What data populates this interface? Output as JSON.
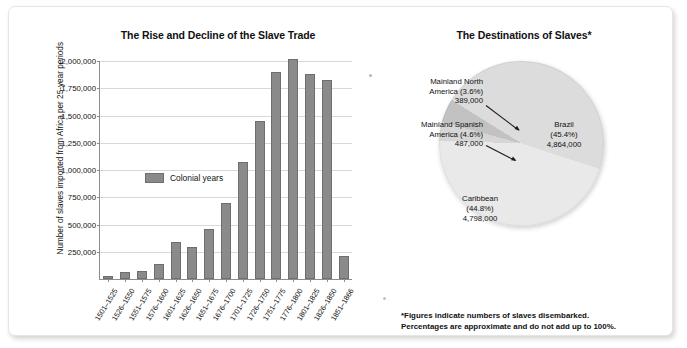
{
  "figure": {
    "bar_title": "The Rise and Decline of the Slave Trade",
    "pie_title": "The Destinations of Slaves*",
    "footnote_line1": "*Figures indicate numbers of slaves disembarked.",
    "footnote_line2": "Percentages are approximate and do not add up to 100%.",
    "legend_label": "Colonial years",
    "bar_color": "#8a8a8a"
  },
  "chart_data": [
    {
      "type": "bar",
      "title": "The Rise and Decline of the Slave Trade",
      "xlabel": "",
      "ylabel": "Number of slaves imported from Africa per 25-year periods",
      "ylim": [
        0,
        2000000
      ],
      "grid": true,
      "legend": [
        "Colonial years"
      ],
      "legend_position": "inside-upper-left",
      "ytick_labels": [
        "2,000,000",
        "1,750,000",
        "1,500,000",
        "1,250,000",
        "1,000,000",
        "750,000",
        "500,000",
        "250,000"
      ],
      "ytick_values": [
        2000000,
        1750000,
        1500000,
        1250000,
        1000000,
        750000,
        500000,
        250000
      ],
      "categories": [
        "1501-1525",
        "1526-1550",
        "1551-1575",
        "1576-1600",
        "1601-1625",
        "1626-1650",
        "1651-1675",
        "1676-1700",
        "1701-1725",
        "1726-1750",
        "1751-1775",
        "1776-1800",
        "1801-1825",
        "1826-1850",
        "1851-1866"
      ],
      "values": [
        25000,
        60000,
        75000,
        140000,
        340000,
        290000,
        460000,
        700000,
        1075000,
        1450000,
        1900000,
        2020000,
        1880000,
        1830000,
        210000
      ]
    },
    {
      "type": "pie",
      "title": "The Destinations of Slaves*",
      "labels": [
        "Mainland North America",
        "Mainland Spanish America",
        "Brazil",
        "Caribbean"
      ],
      "percents": [
        3.6,
        4.6,
        45.4,
        44.8
      ],
      "values": [
        389000,
        487000,
        4864000,
        4798000
      ],
      "value_labels": [
        "389,000",
        "487,000",
        "4,864,000",
        "4,798,000"
      ],
      "percent_labels": [
        "(3.6%)",
        "(4.6%)",
        "(45.4%)",
        "(44.8%)"
      ]
    }
  ],
  "pie_callouts": {
    "north_america": {
      "line1": "Mainland North",
      "line2": "America (3.6%)",
      "line3": "389,000"
    },
    "spanish_america": {
      "line1": "Mainland Spanish",
      "line2": "America (4.6%)",
      "line3": "487,000"
    },
    "brazil": {
      "line1": "Brazil",
      "line2": "(45.4%)",
      "line3": "4,864,000"
    },
    "caribbean": {
      "line1": "Caribbean",
      "line2": "(44.8%)",
      "line3": "4,798,000"
    }
  }
}
